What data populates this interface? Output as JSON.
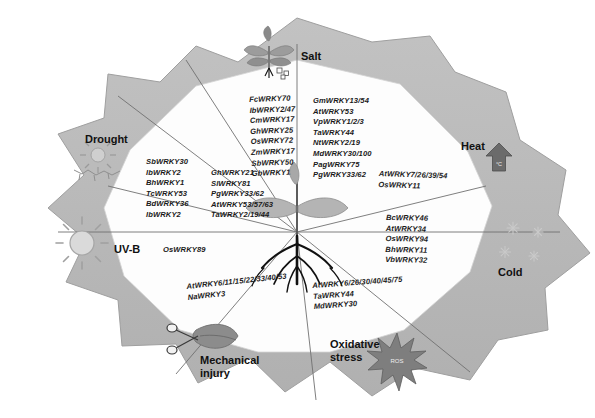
{
  "figure": {
    "center_icon": "seedling-with-roots-icon",
    "background": "#ffffff",
    "lobe_fill": "#b8b8b8",
    "panel_fill": "#fdfdfd",
    "line_color": "#6e6e6e"
  },
  "sectors": [
    {
      "id": "salt",
      "label": "Salt",
      "icon": "wilting-plant-salt-icon",
      "columns": [
        [
          "FcWRKY70",
          "IbWRKY2/47",
          "CmWRKY17",
          "GhWRKY25",
          "OsWRKY72",
          "ZmWRKY17",
          "SbWRKY50",
          "GbWRKY1"
        ],
        [
          "GmWRKY13/54",
          "AtWRKY53",
          "VpWRKY1/2/3",
          "TaWRKY44",
          "NtWRKY2/19",
          "MdWRKY30/100",
          "PagWRKY75",
          "PgWRKY33/62"
        ]
      ]
    },
    {
      "id": "drought",
      "label": "Drought",
      "icon": "sun-over-cracked-soil-icon",
      "columns": [
        [
          "SbWRKY30",
          "IbWRKY2",
          "BhWRKY1",
          "TcWRKY53",
          "BdWRKY36",
          "IbWRKY2"
        ],
        [
          "GhWRKY21",
          "SlWRKY81",
          "PgWRKY33/62",
          "AtWRKY53/57/63",
          "TaWRKY2/19/44"
        ]
      ]
    },
    {
      "id": "heat",
      "label": "Heat",
      "icon": "up-arrow-thermometer-icon",
      "columns": [
        [
          "AtWRKY7/26/39/54",
          "OsWRKY11"
        ]
      ]
    },
    {
      "id": "cold",
      "label": "Cold",
      "icon": "snowflakes-icon",
      "columns": [
        [
          "BcWRKY46",
          "AtWRKY34",
          "OsWRKY94",
          "BhWRKY11",
          "VbWRKY32"
        ]
      ]
    },
    {
      "id": "oxidative-stress",
      "label": "Oxidative\nstress",
      "label_line1": "Oxidative",
      "label_line2": "stress",
      "icon": "ros-starburst-icon",
      "icon_text": "ROS",
      "columns": [
        [
          "AtWRKY6/26/30/40/45/75",
          "TaWRKY44",
          "MdWRKY30"
        ]
      ]
    },
    {
      "id": "mechanical-injury",
      "label": "Mechanical\ninjury",
      "label_line1": "Mechanical",
      "label_line2": "injury",
      "icon": "scissors-cutting-leaf-icon",
      "columns": [
        [
          "AtWRKY6/11/15/22/33/40/53",
          "NaWRKY3"
        ]
      ]
    },
    {
      "id": "uv-b",
      "label": "UV-B",
      "icon": "sun-rays-icon",
      "columns": [
        [
          "OsWRKY89"
        ]
      ]
    }
  ]
}
